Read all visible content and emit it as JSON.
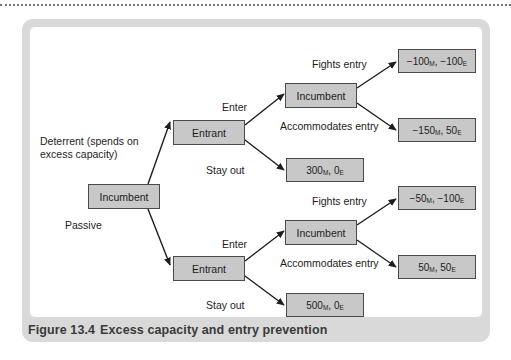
{
  "figure": {
    "caption_number": "Figure 13.4",
    "caption_title": "Excess capacity and entry prevention",
    "frame_color": "#d9d9d9",
    "node_fill_color": "#c8c8c8",
    "node_border_color": "#4a4a4a",
    "canvas_color": "#ffffff"
  },
  "diagram": {
    "type": "game-tree",
    "nodes": {
      "root": {
        "label": "Incumbent"
      },
      "entrant_top": {
        "label": "Entrant"
      },
      "entrant_bottom": {
        "label": "Entrant"
      },
      "incumbent_top": {
        "label": "Incumbent"
      },
      "incumbent_bottom": {
        "label": "Incumbent"
      }
    },
    "edge_labels": {
      "deterrent": "Deterrent (spends on excess capacity)",
      "passive": "Passive",
      "enter_top": "Enter",
      "stay_out_top": "Stay out",
      "enter_bottom": "Enter",
      "stay_out_bottom": "Stay out",
      "fights_entry_top": "Fights entry",
      "accommodates_entry_top": "Accommodates entry",
      "fights_entry_bottom": "Fights entry",
      "accommodates_entry_bottom": "Accommodates entry"
    },
    "payoffs": {
      "top_fights": {
        "incumbent": "−100",
        "incumbent_sub": "M",
        "entrant": "−100",
        "entrant_sub": "E"
      },
      "top_accommodates": {
        "incumbent": "−150",
        "incumbent_sub": "M",
        "entrant": "50",
        "entrant_sub": "E"
      },
      "top_stay_out": {
        "incumbent": "300",
        "incumbent_sub": "M",
        "entrant": "0",
        "entrant_sub": "E"
      },
      "bottom_fights": {
        "incumbent": "−50",
        "incumbent_sub": "M",
        "entrant": "−100",
        "entrant_sub": "E"
      },
      "bottom_accommodates": {
        "incumbent": "50",
        "incumbent_sub": "M",
        "entrant": "50",
        "entrant_sub": "E"
      },
      "bottom_stay_out": {
        "incumbent": "500",
        "incumbent_sub": "M",
        "entrant": "0",
        "entrant_sub": "E"
      }
    }
  }
}
